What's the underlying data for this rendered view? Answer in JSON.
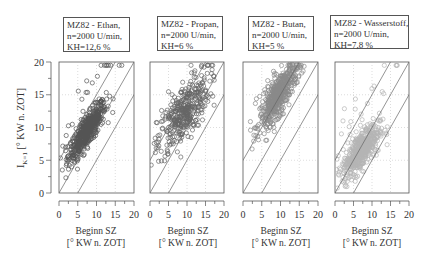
{
  "chart_data": [
    {
      "type": "scatter",
      "title": [
        "MZ82 - Ethan,",
        "n=2000 U/min,",
        "KH=12,6 %"
      ],
      "xlabel": [
        "Beginn SZ",
        "[° KW n. ZOT]"
      ],
      "ylabel": "I_K=1 [° KW n. ZOT]",
      "xlim": [
        0,
        20
      ],
      "ylim": [
        0,
        20
      ],
      "xticks": [
        0,
        5,
        10,
        15,
        20
      ],
      "yticks": [
        0,
        5,
        10,
        15,
        20
      ],
      "grid": "dotted",
      "reference_lines": [
        "y = x + 5",
        "y = x",
        "y = x - 5"
      ],
      "marker_color": "#555555",
      "cluster": {
        "center": [
          7.5,
          9.5
        ],
        "spread": [
          2.5,
          2.2
        ],
        "corr": 0.85,
        "density": "high",
        "note": "dense band near y=x+2, many outliers above (up to y≈19.5)"
      }
    },
    {
      "type": "scatter",
      "title": [
        "MZ82 - Propan,",
        "n=2000 U/min,",
        "KH=6 %"
      ],
      "xlabel": [
        "Beginn SZ",
        "[° KW n. ZOT]"
      ],
      "xlim": [
        0,
        20
      ],
      "ylim": [
        0,
        20
      ],
      "xticks": [
        0,
        5,
        10,
        15,
        20
      ],
      "yticks": [
        0,
        5,
        10,
        15,
        20
      ],
      "grid": "dotted",
      "reference_lines": [
        "y = x + 5",
        "y = x",
        "y = x - 5"
      ],
      "marker_color": "#666666",
      "cluster": {
        "center": [
          9,
          12
        ],
        "spread": [
          3.5,
          3
        ],
        "corr": 0.7,
        "density": "medium",
        "note": "broad spread, upper-left cloud up to y≈20"
      }
    },
    {
      "type": "scatter",
      "title": [
        "MZ82 - Butan,",
        "n=2000 U/min,",
        "KH=5 %"
      ],
      "xlabel": [
        "Beginn SZ",
        "[° KW n. ZOT]"
      ],
      "xlim": [
        0,
        20
      ],
      "ylim": [
        0,
        20
      ],
      "xticks": [
        0,
        5,
        10,
        15,
        20
      ],
      "yticks": [
        0,
        5,
        10,
        15,
        20
      ],
      "grid": "dotted",
      "reference_lines": [
        "y = x + 5",
        "y = x",
        "y = x - 5"
      ],
      "marker_color": "#8a8a8a",
      "cluster": {
        "center": [
          9.5,
          15
        ],
        "spread": [
          2.5,
          2.5
        ],
        "corr": 0.8,
        "density": "high",
        "note": "dense cluster upper region y 10–20"
      }
    },
    {
      "type": "scatter",
      "title": [
        "MZ82 - Wasserstoff,",
        "n=2000 U/min,",
        "KH=7,8 %"
      ],
      "xlabel": [
        "Beginn SZ",
        "[° KW n. ZOT]"
      ],
      "xlim": [
        0,
        20
      ],
      "ylim": [
        0,
        20
      ],
      "xticks": [
        0,
        5,
        10,
        15,
        20
      ],
      "yticks": [
        0,
        5,
        10,
        15,
        20
      ],
      "grid": "dotted",
      "reference_lines": [
        "y = x + 5",
        "y = x",
        "y = x - 5"
      ],
      "marker_color": "#b5b5b5",
      "cluster": {
        "center": [
          7,
          6.5
        ],
        "spread": [
          2.5,
          2
        ],
        "corr": 0.7,
        "density": "high",
        "note": "light dense cloud low region y 2–12"
      }
    }
  ],
  "labels": {
    "ylabel_main": "I",
    "ylabel_sub": "K=1",
    "ylabel_rest": " [° KW n. ZOT]",
    "xlabel_line1": "Beginn SZ",
    "xlabel_line2": "[° KW n. ZOT]"
  },
  "panels": [
    {
      "title1": "MZ82 - Ethan,",
      "title2": "n=2000 U/min,",
      "title3": "KH=12,6 %"
    },
    {
      "title1": "MZ82 - Propan,",
      "title2": "n=2000 U/min,",
      "title3": "KH=6 %"
    },
    {
      "title1": "MZ82 - Butan,",
      "title2": "n=2000 U/min,",
      "title3": "KH=5 %"
    },
    {
      "title1": "MZ82 - Wasserstoff,",
      "title2": "n=2000 U/min,",
      "title3": "KH=7,8 %"
    }
  ]
}
